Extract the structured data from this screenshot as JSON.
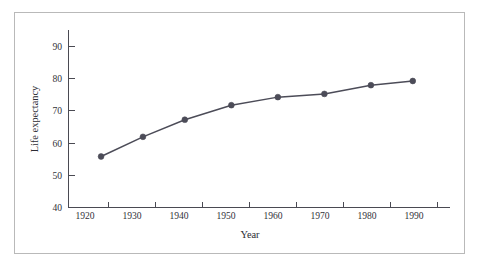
{
  "figure": {
    "background_color": "#ffffff",
    "frame_border_color": "#b9b9b9",
    "has_frame": true
  },
  "chart_data": {
    "type": "line",
    "title": "",
    "subtitle": "",
    "xlabel": "Year",
    "ylabel": "Life expectancy",
    "x": [
      1922,
      1931,
      1940,
      1950,
      1960,
      1970,
      1980,
      1989
    ],
    "values": [
      55.8,
      61.9,
      67.2,
      71.7,
      74.2,
      75.2,
      77.9,
      79.2
    ],
    "series": [
      {
        "name": "Life expectancy",
        "x": [
          1922,
          1931,
          1940,
          1950,
          1960,
          1970,
          1980,
          1989
        ],
        "values": [
          55.8,
          61.9,
          67.2,
          71.7,
          74.2,
          75.2,
          77.9,
          79.2
        ],
        "color": "#4c4c58",
        "marker": "circle",
        "line_style": "solid"
      }
    ],
    "xlim": [
      1915,
      1997
    ],
    "ylim": [
      40,
      95
    ],
    "xticks": [
      1920,
      1930,
      1940,
      1950,
      1960,
      1970,
      1980,
      1990
    ],
    "xtick_labels": [
      "1920",
      "1930",
      "1940",
      "1950",
      "1960",
      "1970",
      "1980",
      "1990"
    ],
    "yticks": [
      40,
      50,
      60,
      70,
      80,
      90
    ],
    "ytick_labels": [
      "40",
      "50",
      "60",
      "70",
      "80",
      "90"
    ],
    "x_minor_ticks": [
      1925,
      1935,
      1945,
      1955,
      1965,
      1975,
      1985,
      1995
    ],
    "grid": false,
    "legend": false,
    "legend_position": "none",
    "annotations": [],
    "line_color": "#4c4c58",
    "marker_color": "#4c4c58",
    "axis_color": "#4a4a52"
  },
  "labels": {
    "y_axis_title": "Life expectancy",
    "x_axis_title": "Year"
  }
}
